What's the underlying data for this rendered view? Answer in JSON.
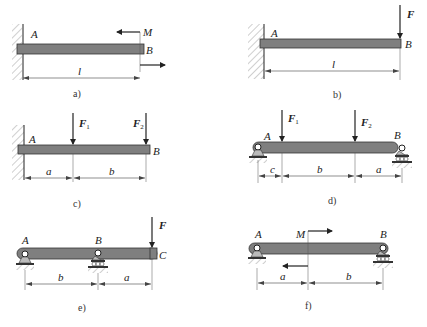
{
  "diagrams": [
    {
      "id": "a",
      "caption": "a)",
      "support": "fixed wall at A",
      "points": {
        "A": "A",
        "B": "B"
      },
      "loads": [
        {
          "type": "couple",
          "label": "M",
          "at": "B"
        }
      ],
      "dimensions": [
        {
          "label": "l",
          "from": "A",
          "to": "B"
        }
      ]
    },
    {
      "id": "b",
      "caption": "b)",
      "support": "fixed wall at A",
      "points": {
        "A": "A",
        "B": "B"
      },
      "loads": [
        {
          "type": "force",
          "label": "F",
          "at": "B",
          "direction": "down"
        }
      ],
      "dimensions": [
        {
          "label": "l",
          "from": "A",
          "to": "B"
        }
      ]
    },
    {
      "id": "c",
      "caption": "c)",
      "support": "fixed wall at A",
      "points": {
        "A": "A",
        "B": "B"
      },
      "loads": [
        {
          "type": "force",
          "label": "F",
          "subscript": "1",
          "direction": "down"
        },
        {
          "type": "force",
          "label": "F",
          "subscript": "2",
          "at": "B",
          "direction": "down"
        }
      ],
      "dimensions": [
        {
          "label": "a"
        },
        {
          "label": "b"
        }
      ]
    },
    {
      "id": "d",
      "caption": "d)",
      "support": "pin at A, roller at B",
      "points": {
        "A": "A",
        "B": "B"
      },
      "loads": [
        {
          "type": "force",
          "label": "F",
          "subscript": "1",
          "direction": "down"
        },
        {
          "type": "force",
          "label": "F",
          "subscript": "2",
          "direction": "down"
        }
      ],
      "dimensions": [
        {
          "label": "c"
        },
        {
          "label": "b"
        },
        {
          "label": "a"
        }
      ]
    },
    {
      "id": "e",
      "caption": "e)",
      "support": "pin at A, roller at B, overhang to C",
      "points": {
        "A": "A",
        "B": "B",
        "C": "C"
      },
      "loads": [
        {
          "type": "force",
          "label": "F",
          "at": "C",
          "direction": "down"
        }
      ],
      "dimensions": [
        {
          "label": "b"
        },
        {
          "label": "a"
        }
      ]
    },
    {
      "id": "f",
      "caption": "f)",
      "support": "pin at A, roller at B",
      "points": {
        "A": "A",
        "B": "B"
      },
      "loads": [
        {
          "type": "couple",
          "label": "M"
        }
      ],
      "dimensions": [
        {
          "label": "a"
        },
        {
          "label": "b"
        }
      ]
    }
  ],
  "colors": {
    "beam": "#7f7f7f",
    "outline": "#333333",
    "wall": "#e6e6e6"
  }
}
